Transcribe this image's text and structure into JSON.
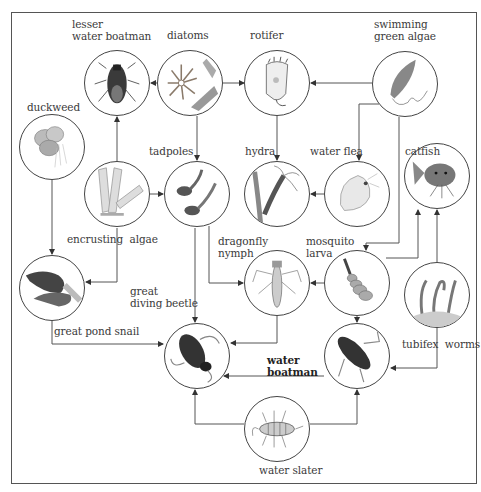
{
  "diagram": {
    "type": "pond food web",
    "organisms": {
      "lesser_water_boatman": "lesser\nwater boatman",
      "diatoms": "diatoms",
      "rotifer": "rotifer",
      "swimming_green_algae": "swimming\ngreen algae",
      "duckweed": "duckweed",
      "encrusting_algae": "encrusting  algae",
      "tadpoles": "tadpoles",
      "hydra": "hydra",
      "water_flea": "water flea",
      "catfish": "catfish",
      "dragonfly_nymph": "dragonfly\nnymph",
      "mosquito_larva": "mosquito\nlarva",
      "great_diving_beetle": "great\ndiving beetle",
      "great_pond_snail": "great pond snail",
      "tubifex_worms": "tubifex  worms",
      "water_boatman": "water\nboatman",
      "water_slater": "water slater"
    },
    "edges": [
      {
        "from": "diatoms",
        "to": "lesser water boatman"
      },
      {
        "from": "diatoms",
        "to": "rotifer"
      },
      {
        "from": "diatoms",
        "to": "tadpoles"
      },
      {
        "from": "swimming green algae",
        "to": "rotifer"
      },
      {
        "from": "swimming green algae",
        "to": "water flea"
      },
      {
        "from": "swimming green algae",
        "to": "mosquito larva"
      },
      {
        "from": "rotifer",
        "to": "hydra"
      },
      {
        "from": "water flea",
        "to": "hydra"
      },
      {
        "from": "encrusting algae",
        "to": "lesser water boatman"
      },
      {
        "from": "encrusting algae",
        "to": "tadpoles"
      },
      {
        "from": "encrusting algae",
        "to": "great pond snail"
      },
      {
        "from": "duckweed",
        "to": "great pond snail"
      },
      {
        "from": "tadpoles",
        "to": "great diving beetle"
      },
      {
        "from": "tadpoles",
        "to": "dragonfly nymph"
      },
      {
        "from": "mosquito larva",
        "to": "dragonfly nymph"
      },
      {
        "from": "mosquito larva",
        "to": "catfish"
      },
      {
        "from": "mosquito larva",
        "to": "water boatman"
      },
      {
        "from": "tubifex worms",
        "to": "catfish"
      },
      {
        "from": "tubifex worms",
        "to": "water boatman"
      },
      {
        "from": "dragonfly nymph",
        "to": "great diving beetle"
      },
      {
        "from": "great pond snail",
        "to": "great diving beetle"
      },
      {
        "from": "water boatman",
        "to": "great diving beetle"
      },
      {
        "from": "water slater",
        "to": "great diving beetle"
      },
      {
        "from": "water slater",
        "to": "water boatman"
      }
    ],
    "colors": {
      "line": "#444444",
      "circle_border": "#444444",
      "text": "#3a3a3a",
      "background": "#ffffff"
    }
  }
}
